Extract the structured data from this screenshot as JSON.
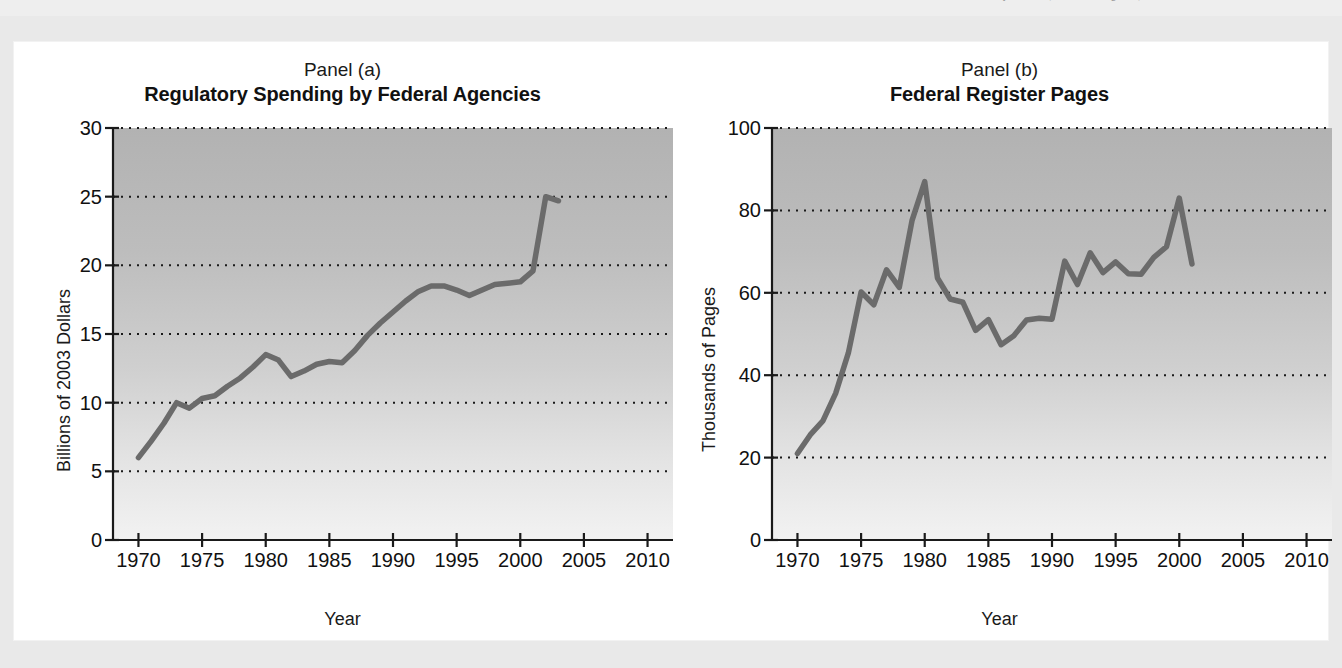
{
  "page": {
    "source_note": "...for University Studies; Federal Register, various issues.",
    "background_color": "#e9e9e9",
    "card_color": "#ffffff",
    "line_color": "#6b6b6b",
    "axis_color": "#1a1a1a"
  },
  "panels": [
    {
      "label": "Panel (a)",
      "title": "Regulatory Spending by Federal Agencies",
      "xlabel": "Year",
      "ylabel": "Billions of 2003 Dollars"
    },
    {
      "label": "Panel (b)",
      "title": "Federal Register Pages",
      "xlabel": "Year",
      "ylabel": "Thousands of Pages"
    }
  ],
  "chart_data": [
    {
      "type": "line",
      "panel": "Panel (a)",
      "title": "Regulatory Spending by Federal Agencies",
      "xlabel": "Year",
      "ylabel": "Billions of 2003 Dollars",
      "xlim": [
        1968,
        2012
      ],
      "ylim": [
        0,
        30
      ],
      "xticks": [
        1970,
        1975,
        1980,
        1985,
        1990,
        1995,
        2000,
        2005,
        2010
      ],
      "yticks": [
        0,
        5,
        10,
        15,
        20,
        25,
        30
      ],
      "xtick_labels": [
        "1970",
        "1975",
        "1980",
        "1985",
        "1990",
        "1995",
        "2000",
        "2005",
        "2010"
      ],
      "ytick_labels": [
        "0",
        "5",
        "10",
        "15",
        "20",
        "25",
        "30"
      ],
      "grid": "horizontal-dotted",
      "legend": "none",
      "x": [
        1970,
        1971,
        1972,
        1973,
        1974,
        1975,
        1976,
        1977,
        1978,
        1979,
        1980,
        1981,
        1982,
        1983,
        1984,
        1985,
        1986,
        1987,
        1988,
        1989,
        1990,
        1991,
        1992,
        1993,
        1994,
        1995,
        1996,
        1997,
        1998,
        1999,
        2000,
        2001,
        2002,
        2003
      ],
      "values": [
        6.0,
        7.2,
        8.5,
        10.0,
        9.6,
        10.3,
        10.5,
        11.2,
        11.8,
        12.6,
        13.5,
        13.1,
        11.9,
        12.3,
        12.8,
        13.0,
        12.9,
        13.8,
        14.9,
        15.8,
        16.6,
        17.4,
        18.1,
        18.5,
        18.5,
        18.2,
        17.8,
        18.2,
        18.6,
        18.7,
        18.8,
        19.6,
        25.0,
        24.7
      ]
    },
    {
      "type": "line",
      "panel": "Panel (b)",
      "title": "Federal Register Pages",
      "xlabel": "Year",
      "ylabel": "Thousands of Pages",
      "xlim": [
        1968,
        2012
      ],
      "ylim": [
        0,
        100
      ],
      "xticks": [
        1970,
        1975,
        1980,
        1985,
        1990,
        1995,
        2000,
        2005,
        2010
      ],
      "yticks": [
        0,
        20,
        40,
        60,
        80,
        100
      ],
      "xtick_labels": [
        "1970",
        "1975",
        "1980",
        "1985",
        "1990",
        "1995",
        "2000",
        "2005",
        "2010"
      ],
      "ytick_labels": [
        "0",
        "20",
        "40",
        "60",
        "80",
        "100"
      ],
      "grid": "horizontal-dotted",
      "legend": "none",
      "x": [
        1970,
        1971,
        1972,
        1973,
        1974,
        1975,
        1976,
        1977,
        1978,
        1979,
        1980,
        1981,
        1982,
        1983,
        1984,
        1985,
        1986,
        1987,
        1988,
        1989,
        1990,
        1991,
        1992,
        1993,
        1994,
        1995,
        1996,
        1997,
        1998,
        1999,
        2000,
        2001
      ],
      "values": [
        21.0,
        25.5,
        28.9,
        35.6,
        45.4,
        60.2,
        57.1,
        65.6,
        61.3,
        77.5,
        87.0,
        63.6,
        58.5,
        57.7,
        50.9,
        53.5,
        47.4,
        49.6,
        53.4,
        53.8,
        53.6,
        67.7,
        62.0,
        69.7,
        64.9,
        67.5,
        64.6,
        64.5,
        68.6,
        71.2,
        83.0,
        67.0
      ]
    }
  ]
}
